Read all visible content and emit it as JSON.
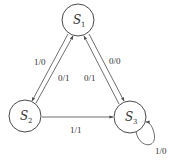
{
  "diagram": {
    "type": "state-transition",
    "states": [
      {
        "id": "S1",
        "letter": "S",
        "sub": "1"
      },
      {
        "id": "S2",
        "letter": "S",
        "sub": "2"
      },
      {
        "id": "S3",
        "letter": "S",
        "sub": "3"
      }
    ],
    "transitions": [
      {
        "from": "S1",
        "to": "S2",
        "label": "1/0"
      },
      {
        "from": "S2",
        "to": "S1",
        "label": "0/1"
      },
      {
        "from": "S3",
        "to": "S1",
        "label": "0/1"
      },
      {
        "from": "S1",
        "to": "S3",
        "label": "0/0"
      },
      {
        "from": "S2",
        "to": "S3",
        "label": "1/1"
      },
      {
        "from": "S3",
        "to": "S3",
        "label": "1/0"
      }
    ]
  }
}
